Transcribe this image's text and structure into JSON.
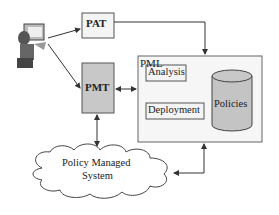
{
  "diagram": {
    "nodes": {
      "user": {
        "icon": "user-computer-icon"
      },
      "pat": {
        "label": "PAT"
      },
      "pmt": {
        "label": "PMT"
      },
      "pml": {
        "label": "PML",
        "analysis": "Analysis",
        "deployment": "Deployment",
        "policies": "Policies"
      },
      "system": {
        "line1": "Policy Managed",
        "line2": "System"
      }
    },
    "edges": [
      {
        "from": "user",
        "to": "pat"
      },
      {
        "from": "user",
        "to": "pmt"
      },
      {
        "from": "pat",
        "to": "pml"
      },
      {
        "from": "pmt",
        "to": "pml",
        "bidirectional": true
      },
      {
        "from": "pmt",
        "to": "system",
        "bidirectional": true
      },
      {
        "from": "pml",
        "to": "system",
        "bidirectional": true
      }
    ],
    "colors": {
      "box_fill": "#f4f4f4",
      "pmt_fill": "#c8c8c8",
      "policies_fill": "#c4c4c4",
      "stroke": "#333333"
    }
  }
}
